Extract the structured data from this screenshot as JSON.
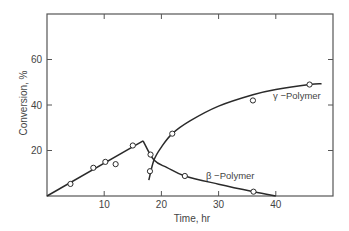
{
  "chart_data": {
    "type": "line",
    "title": "",
    "xlabel": "Time, hr",
    "ylabel": "Conversion, %",
    "xlim": [
      0,
      50
    ],
    "ylim": [
      0,
      80
    ],
    "xticks": [
      10,
      20,
      30,
      40
    ],
    "yticks": [
      20,
      40,
      60
    ],
    "grid": false,
    "legend": "inline labels",
    "series": [
      {
        "name": "initial polymer (linear rise)",
        "line": [
          [
            0,
            0
          ],
          [
            16.8,
            24.2
          ]
        ],
        "points": [
          [
            4.1,
            5.3
          ],
          [
            8.1,
            12.4
          ],
          [
            10.2,
            15.0
          ],
          [
            12.0,
            14.0
          ],
          [
            15.0,
            22.2
          ]
        ]
      },
      {
        "name": "β-Polymer",
        "line": [
          [
            16.8,
            24.2
          ],
          [
            18.7,
            15.8
          ],
          [
            21,
            12.5
          ],
          [
            24.1,
            8.8
          ],
          [
            30,
            5.2
          ],
          [
            36.1,
            1.9
          ],
          [
            40,
            0
          ]
        ],
        "points": [
          [
            18.1,
            18.2
          ],
          [
            24.1,
            8.8
          ],
          [
            36.1,
            1.9
          ]
        ]
      },
      {
        "name": "γ-Polymer",
        "line": [
          [
            17.8,
            7.0
          ],
          [
            18.7,
            15.8
          ],
          [
            20,
            21.5
          ],
          [
            21.9,
            27.4
          ],
          [
            25,
            33
          ],
          [
            30,
            39.5
          ],
          [
            36,
            44.5
          ],
          [
            40,
            46.8
          ],
          [
            45.9,
            49.0
          ],
          [
            48,
            49.3
          ]
        ],
        "points": [
          [
            18.0,
            10.9
          ],
          [
            21.9,
            27.4
          ],
          [
            36.0,
            42.0
          ],
          [
            45.9,
            49.0
          ]
        ]
      }
    ],
    "annotations": [
      {
        "text": "γ −Polymer",
        "x": 39.5,
        "y": 44
      },
      {
        "text": "β −Polymer",
        "x": 28,
        "y": 9
      }
    ]
  },
  "axes": {
    "xlabel": "Time, hr",
    "ylabel": "Conversion, %",
    "xtick_labels": [
      "10",
      "20",
      "30",
      "40"
    ],
    "ytick_labels": [
      "20",
      "40",
      "60"
    ]
  },
  "labels": {
    "gamma": "γ −Polymer",
    "beta": "β −Polymer"
  },
  "colors": {
    "line": "#2a2a2a",
    "frame": "#555555",
    "text": "#444444"
  }
}
